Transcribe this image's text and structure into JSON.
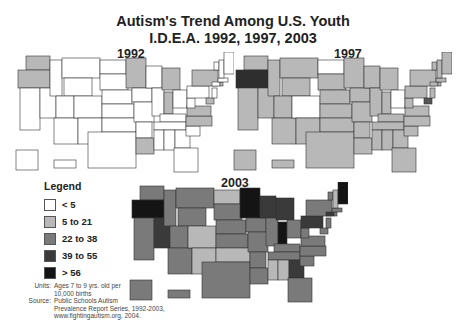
{
  "title": {
    "line1": "Autism's Trend Among U.S. Youth",
    "line2": "I.D.E.A. 1992, 1997, 2003"
  },
  "maps": [
    {
      "year": "1992",
      "base_color": "#ffffff",
      "highlight_states": {
        "WA": "#b8b8b8",
        "OR": "#b8b8b8",
        "MN": "#b8b8b8",
        "MI": "#b8b8b8",
        "IN": "#b8b8b8",
        "NY": "#b8b8b8",
        "VA": "#b8b8b8",
        "NC": "#b8b8b8",
        "LA": "#b8b8b8",
        "MD": "#b8b8b8",
        "RI": "#b8b8b8"
      }
    },
    {
      "year": "1997",
      "base_color": "#b8b8b8",
      "highlight_states": {
        "OR": "#2e2e2e",
        "ND": "#ffffff",
        "CO": "#ffffff",
        "OH": "#ffffff",
        "MD": "#555555"
      }
    },
    {
      "year": "2003",
      "base_color": "#7a7a7a",
      "highlight_states": {
        "OR": "#141414",
        "MN": "#141414",
        "IN": "#141414",
        "ME": "#141414",
        "NV": "#3a3a3a",
        "WI": "#3a3a3a",
        "MI": "#3a3a3a",
        "PA": "#3a3a3a",
        "GA": "#3a3a3a",
        "CT": "#3a3a3a",
        "ND": "#b8b8b8",
        "CO": "#b8b8b8",
        "NM": "#b8b8b8",
        "OK": "#b8b8b8",
        "MS": "#b8b8b8",
        "AL": "#b8b8b8",
        "NH": "#b8b8b8"
      }
    }
  ],
  "legend": {
    "title": "Legend",
    "items": [
      {
        "label": "< 5",
        "color": "#ffffff"
      },
      {
        "label": "5 to 21",
        "color": "#b8b8b8"
      },
      {
        "label": "22 to 38",
        "color": "#7a7a7a"
      },
      {
        "label": "39 to 55",
        "color": "#3a3a3a"
      },
      {
        "label": "> 56",
        "color": "#141414"
      }
    ]
  },
  "notes": {
    "units_key": "Units:",
    "units_line1": "Ages 7 to 9 yrs. old per",
    "units_line2": "10,000 births",
    "source_key": "Source:",
    "source_line1": "Public Schools Autism",
    "source_line2": "Prevalence Report Series, 1992-2003,",
    "source_line3": "www.fightingautism.org, 2004."
  }
}
